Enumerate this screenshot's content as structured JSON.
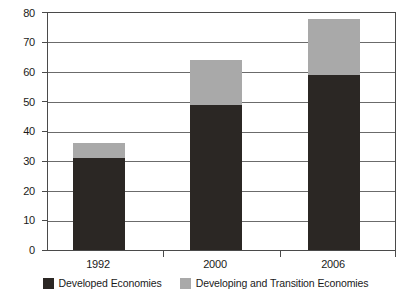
{
  "chart_data": {
    "type": "bar",
    "stacked": true,
    "title": "",
    "subtitle": "",
    "xlabel": "",
    "ylabel": "",
    "categories": [
      "1992",
      "2000",
      "2006"
    ],
    "series": [
      {
        "name": "Developed Economies",
        "color": "#2b2724",
        "values": [
          31,
          49,
          59
        ]
      },
      {
        "name": "Developing and Transition Economies",
        "color": "#a9a9a9",
        "values": [
          5,
          15,
          19
        ]
      }
    ],
    "totals": [
      36,
      64,
      78
    ],
    "ylim": [
      0,
      80
    ],
    "ytick_step": 10,
    "yticks": [
      "0",
      "10",
      "20",
      "30",
      "40",
      "50",
      "60",
      "70",
      "80"
    ],
    "grid": true,
    "grid_axis": "y",
    "legend_position": "bottom"
  },
  "axes": {
    "y_tick_labels": [
      "80",
      "70",
      "60",
      "50",
      "40",
      "30",
      "20",
      "10",
      "0"
    ],
    "x_tick_labels": [
      "1992",
      "2000",
      "2006"
    ]
  },
  "legend": {
    "items": [
      {
        "label": "Developed Economies",
        "swatch_name": "legend-swatch-developed"
      },
      {
        "label": "Developing and Transition Economies",
        "swatch_name": "legend-swatch-developing"
      }
    ]
  },
  "colors": {
    "developed": "#2b2724",
    "developing": "#a9a9a9",
    "grid": "#6b6b6b",
    "axis": "#4a4a4a",
    "background": "#ffffff"
  }
}
